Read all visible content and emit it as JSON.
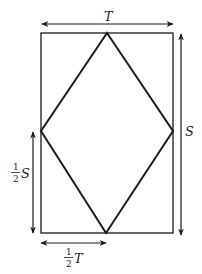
{
  "diagram": {
    "labels": {
      "top_width": "T",
      "right_height": "S",
      "left_half_height": {
        "numerator": "1",
        "denominator": "2",
        "variable": "S"
      },
      "bottom_half_width": {
        "numerator": "1",
        "denominator": "2",
        "variable": "T"
      }
    },
    "colors": {
      "stroke": "#1a1a1a",
      "background": "#ffffff"
    }
  }
}
